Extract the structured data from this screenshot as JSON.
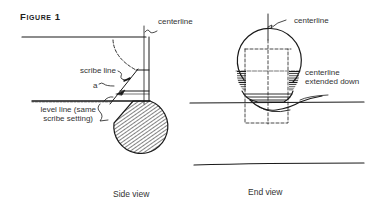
{
  "figure": {
    "title": "Figure 1"
  },
  "side_view": {
    "caption": "Side view",
    "labels": {
      "centerline": "centerline",
      "scribe_line": "scribe line",
      "a": "a",
      "level_line_1": "level line (same",
      "level_line_2": "scribe setting)"
    }
  },
  "end_view": {
    "caption": "End view",
    "labels": {
      "centerline": "centerline",
      "centerline_ext_1": "centerline",
      "centerline_ext_2": "extended down"
    }
  },
  "colors": {
    "ink": "#1a1a1a",
    "background": "#ffffff"
  }
}
